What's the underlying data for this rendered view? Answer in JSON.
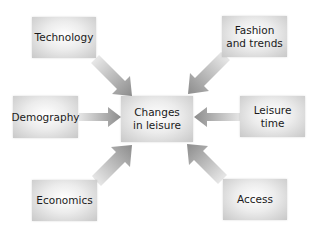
{
  "diagram": {
    "center": {
      "label": "Changes\nin leisure"
    },
    "factors": [
      {
        "id": "technology",
        "label": "Technology"
      },
      {
        "id": "fashion",
        "label": "Fashion\nand trends"
      },
      {
        "id": "demography",
        "label": "Demography"
      },
      {
        "id": "leisure-time",
        "label": "Leisure\ntime"
      },
      {
        "id": "economics",
        "label": "Economics"
      },
      {
        "id": "access",
        "label": "Access"
      }
    ],
    "colors": {
      "arrow": "#8c8c8c",
      "box_light": "#ffffff",
      "box_dark": "#c8c8c8",
      "text": "#1a1a1a"
    }
  }
}
